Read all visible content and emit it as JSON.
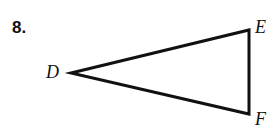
{
  "page": {
    "background_color": "#ffffff",
    "width": 275,
    "height": 133
  },
  "problem": {
    "number_label": "8."
  },
  "figure": {
    "type": "triangle",
    "stroke_color": "#111111",
    "stroke_width": 3,
    "fill": "none",
    "vertices": [
      {
        "name": "D",
        "label": "D",
        "x": 71,
        "y": 73
      },
      {
        "name": "E",
        "label": "E",
        "x": 249,
        "y": 30
      },
      {
        "name": "F",
        "label": "F",
        "x": 249,
        "y": 114
      }
    ],
    "edges": [
      {
        "name": "DE",
        "from": "D",
        "to": "E"
      },
      {
        "name": "EF",
        "from": "E",
        "to": "F"
      },
      {
        "name": "FD",
        "from": "F",
        "to": "D"
      }
    ],
    "polygon_points": "71,73 249,30 249,114"
  },
  "labels": {
    "D": "D",
    "E": "E",
    "F": "F"
  }
}
